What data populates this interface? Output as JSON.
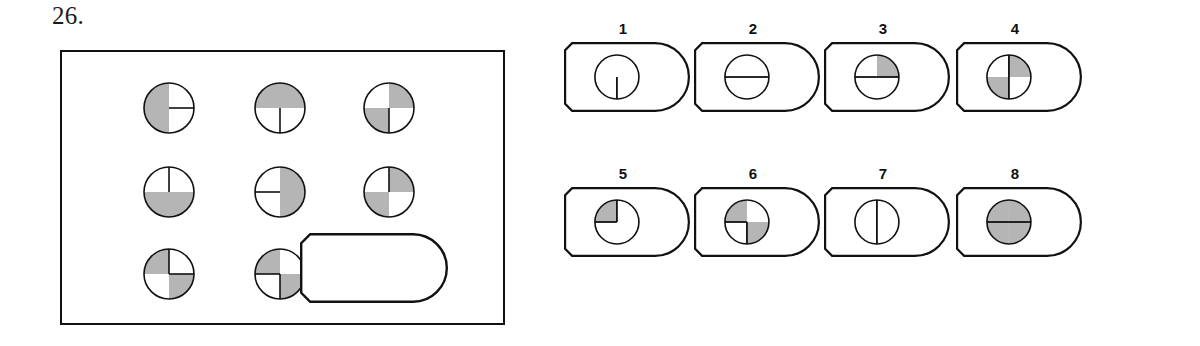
{
  "question": {
    "number": "26.",
    "type": "visual-analogy-matrix"
  },
  "colors": {
    "stroke": "#111111",
    "shade": "#b5b5b5",
    "background": "#ffffff",
    "label": "#111111"
  },
  "matrix": {
    "rows": 3,
    "cols": 3,
    "cells": [
      {
        "id": "r1c1",
        "row": 1,
        "col": 1,
        "kind": "circle",
        "name": "matrix-cell-r1c1",
        "shaded": [
          "top-left",
          "bottom-left"
        ],
        "spokes": [
          "right"
        ]
      },
      {
        "id": "r1c2",
        "row": 1,
        "col": 2,
        "kind": "circle",
        "name": "matrix-cell-r1c2",
        "shaded": [
          "top-left",
          "top-right"
        ],
        "spokes": [
          "down"
        ]
      },
      {
        "id": "r1c3",
        "row": 1,
        "col": 3,
        "kind": "circle",
        "name": "matrix-cell-r1c3",
        "shaded": [
          "top-right",
          "bottom-left"
        ],
        "spokes": [
          "down"
        ]
      },
      {
        "id": "r2c1",
        "row": 2,
        "col": 1,
        "kind": "circle",
        "name": "matrix-cell-r2c1",
        "shaded": [
          "bottom-left",
          "bottom-right"
        ],
        "spokes": [
          "up"
        ]
      },
      {
        "id": "r2c2",
        "row": 2,
        "col": 2,
        "kind": "circle",
        "name": "matrix-cell-r2c2",
        "shaded": [
          "top-right",
          "bottom-right"
        ],
        "spokes": [
          "left"
        ]
      },
      {
        "id": "r2c3",
        "row": 2,
        "col": 3,
        "kind": "circle",
        "name": "matrix-cell-r2c3",
        "shaded": [
          "top-right",
          "bottom-left"
        ],
        "spokes": [
          "up"
        ]
      },
      {
        "id": "r3c1",
        "row": 3,
        "col": 1,
        "kind": "circle",
        "name": "matrix-cell-r3c1",
        "shaded": [
          "top-left",
          "bottom-right"
        ],
        "spokes": [
          "up",
          "right"
        ]
      },
      {
        "id": "r3c2",
        "row": 3,
        "col": 2,
        "kind": "circle",
        "name": "matrix-cell-r3c2",
        "shaded": [
          "top-left",
          "bottom-right"
        ],
        "spokes": [
          "left",
          "down"
        ]
      },
      {
        "id": "r3c3",
        "row": 3,
        "col": 3,
        "kind": "blank-tag",
        "name": "matrix-cell-missing-piece",
        "shaded": [],
        "spokes": []
      }
    ]
  },
  "options": [
    {
      "label": "1",
      "name": "option-1",
      "shaded": [],
      "spokes": [
        "down"
      ]
    },
    {
      "label": "2",
      "name": "option-2",
      "shaded": [],
      "spokes": [
        "left",
        "right"
      ]
    },
    {
      "label": "3",
      "name": "option-3",
      "shaded": [
        "top-right"
      ],
      "spokes": [
        "left",
        "right"
      ]
    },
    {
      "label": "4",
      "name": "option-4",
      "shaded": [
        "top-right",
        "bottom-left"
      ],
      "spokes": [
        "up",
        "down"
      ]
    },
    {
      "label": "5",
      "name": "option-5",
      "shaded": [
        "top-left"
      ],
      "spokes": [
        "up",
        "left"
      ]
    },
    {
      "label": "6",
      "name": "option-6",
      "shaded": [
        "top-left",
        "bottom-right"
      ],
      "spokes": [
        "left",
        "down"
      ]
    },
    {
      "label": "7",
      "name": "option-7",
      "shaded": [],
      "spokes": [
        "up",
        "down"
      ]
    },
    {
      "label": "8",
      "name": "option-8",
      "shaded": [
        "top-left",
        "top-right",
        "bottom-left",
        "bottom-right"
      ],
      "spokes": [
        "left",
        "right"
      ]
    }
  ]
}
